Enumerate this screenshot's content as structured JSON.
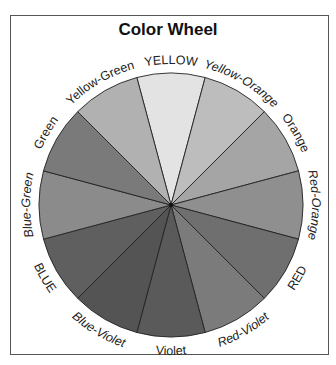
{
  "title": "Color Wheel",
  "wheel": {
    "center": [
      171,
      205
    ],
    "radius": 132,
    "label_radius": 141,
    "segments": [
      {
        "label": "YELLOW",
        "fill": "#e3e3e3",
        "start": -105,
        "end": -75,
        "italic": false
      },
      {
        "label": "Yellow-Orange",
        "fill": "#bdbdbd",
        "start": -75,
        "end": -45,
        "italic": true
      },
      {
        "label": "Orange",
        "fill": "#a5a5a5",
        "start": -45,
        "end": -15,
        "italic": false
      },
      {
        "label": "Red-Orange",
        "fill": "#8f8f8f",
        "start": -15,
        "end": 15,
        "italic": true
      },
      {
        "label": "RED",
        "fill": "#6f6f6f",
        "start": 15,
        "end": 45,
        "italic": false
      },
      {
        "label": "Red-Violet",
        "fill": "#7b7b7b",
        "start": 45,
        "end": 75,
        "italic": true
      },
      {
        "label": "Violet",
        "fill": "#5a5a5a",
        "start": 75,
        "end": 105,
        "italic": false
      },
      {
        "label": "Blue-Violet",
        "fill": "#545454",
        "start": 105,
        "end": 135,
        "italic": true
      },
      {
        "label": "BLUE",
        "fill": "#5f5f5f",
        "start": 135,
        "end": 165,
        "italic": false
      },
      {
        "label": "Blue-Green",
        "fill": "#8b8b8b",
        "start": 165,
        "end": 195,
        "italic": true
      },
      {
        "label": "Green",
        "fill": "#7a7a7a",
        "start": 195,
        "end": 225,
        "italic": false
      },
      {
        "label": "Yellow-Green",
        "fill": "#b1b1b1",
        "start": 225,
        "end": 255,
        "italic": false
      }
    ]
  }
}
